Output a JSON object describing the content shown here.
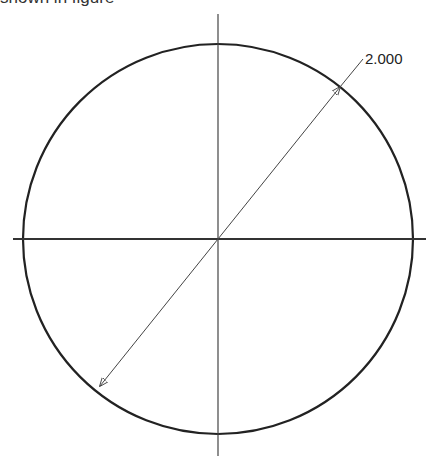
{
  "caption": {
    "text": "shown in figure"
  },
  "drawing": {
    "type": "circle-with-centerlines",
    "dimension": {
      "label": "2.000",
      "kind": "diameter"
    },
    "colors": {
      "stroke": "#222222",
      "thin": "#444444",
      "background": "#ffffff"
    }
  }
}
